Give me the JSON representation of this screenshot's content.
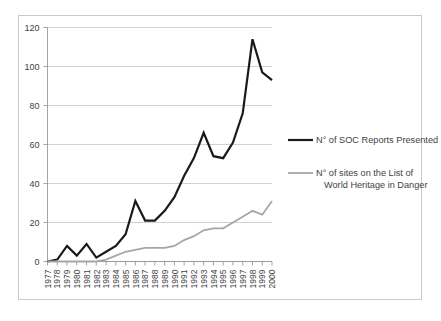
{
  "chart_data": {
    "type": "line",
    "title": "",
    "subtitle": "",
    "xlabel": "",
    "ylabel": "",
    "grid": true,
    "legend_position": "right",
    "ylim": [
      0,
      120
    ],
    "yticks": [
      0,
      20,
      40,
      60,
      80,
      100,
      120
    ],
    "ytick_labels": [
      "0",
      "20",
      "40",
      "60",
      "80",
      "100",
      "120"
    ],
    "categories": [
      "1977",
      "1978",
      "1979",
      "1980",
      "1981",
      "1982",
      "1983",
      "1984",
      "1985",
      "1986",
      "1987",
      "1988",
      "1989",
      "1990",
      "1991",
      "1992",
      "1993",
      "1994",
      "1995",
      "1996",
      "1997",
      "1998",
      "1999",
      "2000"
    ],
    "series": [
      {
        "name": "N° of SOC Reports Presented",
        "color": "#1a1a1a",
        "width": 2.2,
        "values": [
          0,
          1,
          8,
          3,
          9,
          2,
          5,
          8,
          14,
          31,
          21,
          21,
          26,
          33,
          44,
          53,
          66,
          54,
          53,
          61,
          76,
          114,
          97,
          93
        ]
      },
      {
        "name": "N° of sites on the List of World Heritage in Danger",
        "color": "#a6a6a6",
        "width": 1.8,
        "values": [
          0,
          0,
          0,
          0,
          0,
          0,
          1,
          3,
          5,
          6,
          7,
          7,
          7,
          8,
          11,
          13,
          16,
          17,
          17,
          20,
          23,
          26,
          24,
          31
        ]
      }
    ]
  },
  "legend": {
    "entries": [
      {
        "label": "N° of SOC Reports Presented",
        "label_line2": "",
        "color": "#1a1a1a"
      },
      {
        "label": "N° of sites on the List of",
        "label_line2": "World Heritage in Danger",
        "color": "#a6a6a6"
      }
    ]
  }
}
